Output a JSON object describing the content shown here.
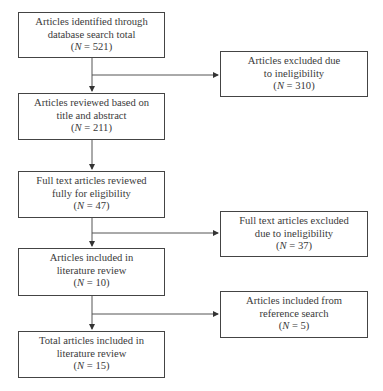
{
  "flow": {
    "main": [
      {
        "line1": "Articles identified through",
        "line2": "database search total",
        "n_label": "N",
        "n_value": "521"
      },
      {
        "line1": "Articles reviewed based on",
        "line2": "title and abstract",
        "n_label": "N",
        "n_value": "211"
      },
      {
        "line1": "Full text articles reviewed",
        "line2": "fully for eligibility",
        "n_label": "N",
        "n_value": "47"
      },
      {
        "line1": "Articles included in",
        "line2": "literature review",
        "n_label": "N",
        "n_value": "10"
      },
      {
        "line1": "Total articles included in",
        "line2": "literature review",
        "n_label": "N",
        "n_value": "15"
      }
    ],
    "side": [
      {
        "line1": "Articles excluded due",
        "line2": "to ineligibility",
        "n_label": "N",
        "n_value": "310"
      },
      {
        "line1": "Full text articles excluded",
        "line2": "due to ineligibility",
        "n_label": "N",
        "n_value": "37"
      },
      {
        "line1": "Articles included from",
        "line2": "reference search",
        "n_label": "N",
        "n_value": "5"
      }
    ]
  },
  "colors": {
    "line": "#444444",
    "text": "#3a3a3a",
    "background": "#ffffff"
  }
}
